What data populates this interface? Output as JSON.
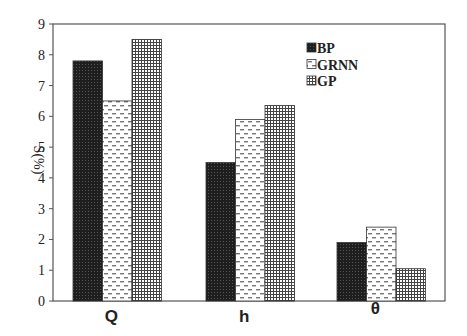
{
  "chart_data": {
    "type": "bar",
    "title": "",
    "xlabel": "",
    "ylabel": "S(%)",
    "ylim": [
      0,
      9
    ],
    "yticks": [
      0,
      1,
      2,
      3,
      4,
      5,
      6,
      7,
      8,
      9
    ],
    "grid": false,
    "legend_position": "upper-right-inside",
    "categories": [
      "Q",
      "h",
      "θ"
    ],
    "series": [
      {
        "name": "BP",
        "pattern": "dark-stipple",
        "values": [
          7.8,
          4.5,
          1.9
        ]
      },
      {
        "name": "GRNN",
        "pattern": "dashes",
        "values": [
          6.5,
          5.9,
          2.4
        ]
      },
      {
        "name": "GP",
        "pattern": "grid",
        "values": [
          8.5,
          6.35,
          1.05
        ]
      }
    ]
  }
}
